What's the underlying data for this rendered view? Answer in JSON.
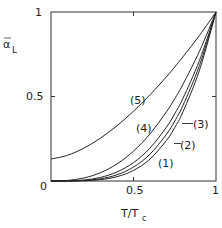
{
  "chart_data": {
    "type": "line",
    "title": "",
    "xlabel": "T/T_c",
    "ylabel": "ᾱ_L",
    "xlim": [
      0,
      1
    ],
    "ylim": [
      0,
      1
    ],
    "grid": false,
    "legend": "inline labels",
    "x_ticks": [
      "0",
      "0.5",
      "1"
    ],
    "y_ticks": [
      "0.5",
      "1"
    ],
    "x": [
      0,
      0.1,
      0.2,
      0.3,
      0.4,
      0.5,
      0.6,
      0.7,
      0.75,
      0.8,
      0.9,
      1.0
    ],
    "series": [
      {
        "name": "(1)",
        "values": [
          0,
          0.0001,
          0.0016,
          0.0081,
          0.0256,
          0.0625,
          0.1296,
          0.2401,
          0.3164,
          0.4096,
          0.6561,
          1.0
        ]
      },
      {
        "name": "(2)",
        "values": [
          0,
          0.0003,
          0.003,
          0.0131,
          0.037,
          0.0825,
          0.1587,
          0.2769,
          0.3546,
          0.4479,
          0.6842,
          1.0
        ]
      },
      {
        "name": "(3)",
        "values": [
          0,
          0.0006,
          0.0058,
          0.0212,
          0.0535,
          0.1088,
          0.1947,
          0.3193,
          0.3988,
          0.4897,
          0.7139,
          1.0
        ]
      },
      {
        "name": "(4)",
        "values": [
          0,
          0.0032,
          0.0179,
          0.0493,
          0.1012,
          0.1768,
          0.2789,
          0.41,
          0.4871,
          0.5724,
          0.7684,
          1.0
        ]
      },
      {
        "name": "(5)",
        "values": [
          0.13,
          0.152,
          0.195,
          0.254,
          0.327,
          0.413,
          0.51,
          0.617,
          0.675,
          0.735,
          0.862,
          1.0
        ]
      }
    ]
  },
  "labels": {
    "x_axis": "T/T",
    "x_axis_sub": "c",
    "y_axis": "α",
    "y_axis_sub": "L",
    "origin": "0",
    "x_mid": "0.5",
    "x_max": "1",
    "y_mid": "0.5",
    "y_max": "1",
    "curve1": "(1)",
    "curve2": "(2)",
    "curve3": "(3)",
    "curve4": "(4)",
    "curve5": "(5)"
  }
}
